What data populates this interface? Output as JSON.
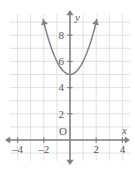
{
  "chart_data": {
    "type": "line",
    "title": "",
    "xlabel": "x",
    "ylabel": "y",
    "equation": "y = x^2 + 5",
    "vertex": [
      0,
      5
    ],
    "xlim": [
      -4.6,
      4.6
    ],
    "ylim": [
      -1.6,
      9.6
    ],
    "grid": true,
    "legend": null,
    "x_ticks": [
      -4,
      -2,
      2,
      4
    ],
    "x_tick_labels": [
      "–4",
      "–2",
      "2",
      "4"
    ],
    "y_ticks": [
      2,
      4,
      6,
      8
    ],
    "y_tick_labels": [
      "2",
      "4",
      "6",
      "8"
    ],
    "origin_label": "O",
    "grid_step": 1,
    "series": [
      {
        "name": "parabola",
        "x": [
          -2.05,
          -1.9,
          -1.75,
          -1.6,
          -1.45,
          -1.3,
          -1.15,
          -1.0,
          -0.85,
          -0.7,
          -0.55,
          -0.4,
          -0.25,
          -0.1,
          0,
          0.1,
          0.25,
          0.4,
          0.55,
          0.7,
          0.85,
          1.0,
          1.15,
          1.3,
          1.45,
          1.6,
          1.75,
          1.9,
          2.05
        ],
        "y": [
          9.2,
          8.61,
          8.06,
          7.56,
          7.1,
          6.69,
          6.32,
          6.0,
          5.72,
          5.49,
          5.3,
          5.16,
          5.06,
          5.01,
          5.0,
          5.01,
          5.06,
          5.16,
          5.3,
          5.49,
          5.72,
          6.0,
          6.32,
          6.69,
          7.1,
          7.56,
          8.06,
          8.61,
          9.2
        ],
        "color": "#808285",
        "arrow_start": true,
        "arrow_end": true
      }
    ],
    "colors": {
      "grid": "#d9d9d9",
      "axis": "#808285",
      "curve": "#808285",
      "text": "#58595b",
      "background": "#ffffff"
    }
  },
  "axes": {
    "x_axis_name": "x",
    "y_axis_name": "y",
    "origin": "O"
  }
}
